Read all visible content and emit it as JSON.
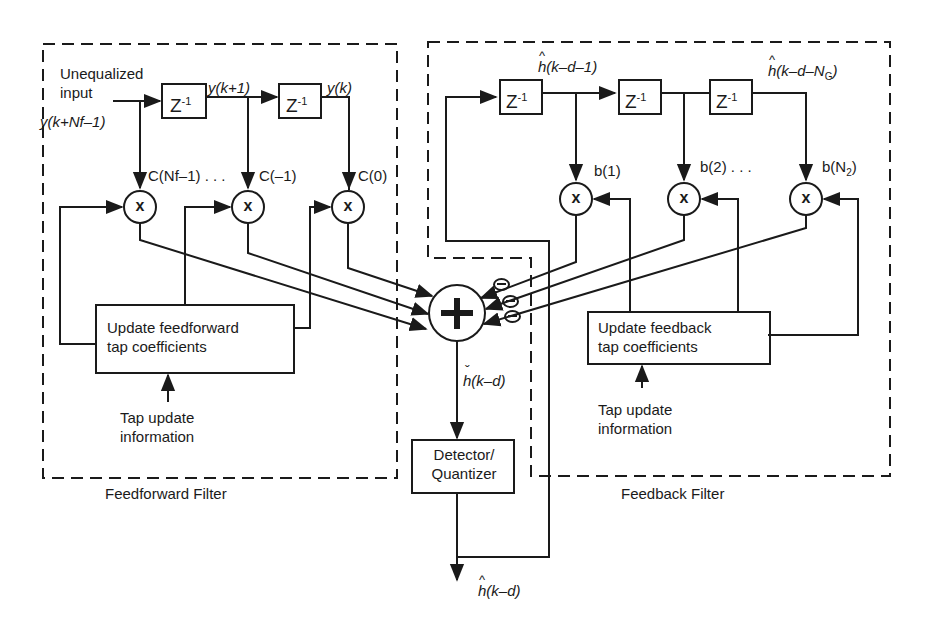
{
  "diagram": {
    "type": "decision-feedback-equalizer",
    "regions": {
      "feedforward": {
        "caption": "Feedforward Filter"
      },
      "feedback": {
        "caption": "Feedback Filter"
      }
    },
    "input": {
      "label_line1": "Unequalized",
      "label_line2": "input",
      "signal": "y(k+Nf–1)"
    },
    "feedforward": {
      "delay_label": "Z",
      "delay_exp": "-1",
      "taps": [
        {
          "signal": "y(k+1)"
        },
        {
          "signal": "y(k)"
        }
      ],
      "coefficients": [
        "C(Nf–1) . . .",
        "C(–1)",
        "C(0)"
      ],
      "multiplier_symbol": "x",
      "update_box": {
        "line1": "Update feedforward",
        "line2": "tap coefficients"
      },
      "tap_update": {
        "line1": "Tap update",
        "line2": "information"
      }
    },
    "feedback": {
      "delay_label": "Z",
      "delay_exp": "-1",
      "signals": [
        "h(k–d–1)",
        "h(k–d–N_G)"
      ],
      "signal_first": "h(k–d–1)",
      "signal_last_base": "h(k–d–N",
      "signal_last_sub": "G",
      "coefficients": [
        "b(1)",
        "b(2) . . .",
        "b(N_2)"
      ],
      "coef_last_base": "b(N",
      "coef_last_sub": "2",
      "multiplier_symbol": "x",
      "update_box": {
        "line1": "Update feedback",
        "line2": "tap coefficients"
      },
      "tap_update": {
        "line1": "Tap update",
        "line2": "information"
      }
    },
    "summer": {
      "symbol": "+",
      "negative_inputs": 3
    },
    "summer_output": "h(k–d)",
    "detector": {
      "line1": "Detector/",
      "line2": "Quantizer"
    },
    "output": "h(k–d)"
  }
}
